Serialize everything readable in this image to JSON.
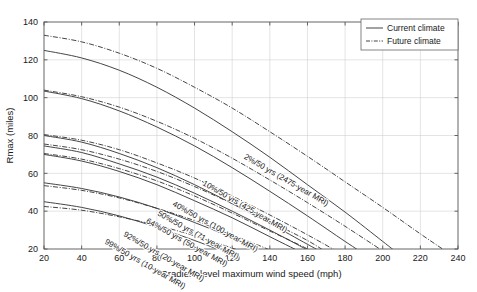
{
  "chart_data": {
    "type": "line",
    "title": "",
    "xlabel": "Gradient-level maximum wind speed (mph)",
    "ylabel": "Rmax (miles)",
    "xlim": [
      20,
      240
    ],
    "ylim": [
      20,
      140
    ],
    "xticks": [
      20,
      40,
      60,
      80,
      100,
      120,
      140,
      160,
      180,
      200,
      220,
      240
    ],
    "yticks": [
      20,
      40,
      60,
      80,
      100,
      120,
      140
    ],
    "grid": true,
    "legend_position": "top-right",
    "legend": [
      {
        "name": "Current climate",
        "style": "solid"
      },
      {
        "name": "Future climate",
        "style": "dash-dot"
      }
    ],
    "annotations": [
      "2%/50 yrs (2475-year MRI)",
      "10%/50 yrs (425-year MRI)",
      "40%/50 yrs (100-year MRI)",
      "50%/50 yrs (71-year MRI)",
      "64%/50 yrs (50-year MRI)",
      "92%/50 yrs (20-year MRI)",
      "99%/50 yrs (10-year MRI)"
    ],
    "series": [
      {
        "name": "2%/50 yrs (2475-year MRI)",
        "climate": "Current climate",
        "style": "solid",
        "x": [
          20,
          40,
          60,
          80,
          100,
          120,
          140,
          160,
          180,
          200,
          207
        ],
        "y": [
          125,
          121,
          114.5,
          105.5,
          94.5,
          82,
          68.5,
          54,
          39.5,
          24,
          18.5
        ]
      },
      {
        "name": "2%/50 yrs (2475-year MRI)",
        "climate": "Future climate",
        "style": "dash-dot",
        "x": [
          20,
          40,
          60,
          80,
          100,
          120,
          140,
          160,
          180,
          200,
          220,
          237
        ],
        "y": [
          133,
          129.5,
          123.5,
          115.5,
          105.5,
          94.5,
          82,
          69,
          55.5,
          42,
          28,
          16.5
        ]
      },
      {
        "name": "10%/50 yrs (425-year MRI)",
        "climate": "Current climate",
        "style": "solid",
        "x": [
          20,
          40,
          60,
          80,
          100,
          120,
          140,
          160,
          180,
          193
        ],
        "y": [
          103.5,
          99.5,
          93,
          84.5,
          74.5,
          63,
          50.5,
          37.5,
          24,
          15.5
        ]
      },
      {
        "name": "10%/50 yrs (425-year MRI)",
        "climate": "Future climate",
        "style": "dash-dot",
        "x": [
          20,
          40,
          60,
          80,
          100,
          120,
          140,
          160,
          180,
          200,
          207
        ],
        "y": [
          104,
          100.5,
          95,
          87.5,
          78.5,
          68,
          56.5,
          44.5,
          32,
          19,
          14.5
        ]
      },
      {
        "name": "40%/50 yrs (100-year MRI)",
        "climate": "Current climate",
        "style": "solid",
        "x": [
          20,
          40,
          60,
          80,
          100,
          120,
          140,
          160,
          172
        ],
        "y": [
          80,
          76.5,
          70.5,
          63,
          54,
          44,
          33.5,
          22.5,
          16
        ]
      },
      {
        "name": "40%/50 yrs (100-year MRI)",
        "climate": "Future climate",
        "style": "dash-dot",
        "x": [
          20,
          40,
          60,
          80,
          100,
          120,
          140,
          160,
          178
        ],
        "y": [
          80.5,
          77.5,
          72.5,
          65.5,
          57.5,
          48,
          38,
          27.5,
          17.5
        ]
      },
      {
        "name": "50%/50 yrs (71-year MRI)",
        "climate": "Current climate",
        "style": "solid",
        "x": [
          20,
          40,
          60,
          80,
          100,
          120,
          140,
          160,
          168
        ],
        "y": [
          74.5,
          71,
          65,
          58,
          49.5,
          40,
          30,
          19.5,
          15
        ]
      },
      {
        "name": "50%/50 yrs (71-year MRI)",
        "climate": "Future climate",
        "style": "dash-dot",
        "x": [
          20,
          40,
          60,
          80,
          100,
          120,
          140,
          160,
          172
        ],
        "y": [
          75.5,
          72.5,
          67.5,
          61,
          53,
          44,
          34.5,
          24.5,
          17
        ]
      },
      {
        "name": "64%/50 yrs (50-year MRI)",
        "climate": "Current climate",
        "style": "solid",
        "x": [
          20,
          40,
          60,
          80,
          100,
          120,
          140,
          160,
          164
        ],
        "y": [
          70,
          66.5,
          61,
          54,
          45.5,
          36.5,
          26.5,
          16.5,
          13.5
        ]
      },
      {
        "name": "64%/50 yrs (50-year MRI)",
        "climate": "Future climate",
        "style": "dash-dot",
        "x": [
          20,
          40,
          60,
          80,
          100,
          120,
          140,
          160,
          168
        ],
        "y": [
          70.5,
          67.5,
          62.5,
          56,
          48,
          39,
          29.5,
          20,
          14
        ]
      },
      {
        "name": "92%/50 yrs (20-year MRI)",
        "climate": "Current climate",
        "style": "solid",
        "x": [
          20,
          40,
          60,
          80,
          100,
          120,
          140,
          150
        ],
        "y": [
          55,
          52,
          47.5,
          41.5,
          34,
          26,
          17,
          12.5
        ]
      },
      {
        "name": "92%/50 yrs (20-year MRI)",
        "climate": "Future climate",
        "style": "dash-dot",
        "x": [
          20,
          40,
          60,
          80,
          100,
          120,
          140,
          156
        ],
        "y": [
          53.5,
          51,
          47,
          41.5,
          35,
          27.5,
          19.5,
          12.5
        ]
      },
      {
        "name": "99%/50 yrs (10-year MRI)",
        "climate": "Current climate",
        "style": "solid",
        "x": [
          20,
          40,
          60,
          80,
          100,
          112
        ],
        "y": [
          45,
          42,
          37.5,
          31.5,
          24.5,
          20
        ]
      },
      {
        "name": "99%/50 yrs (10-year MRI)",
        "climate": "Future climate",
        "style": "dash-dot",
        "x": [
          20,
          40,
          60,
          80,
          100,
          120,
          134
        ],
        "y": [
          42.5,
          40.5,
          37,
          32.5,
          27,
          20.5,
          15.5
        ]
      }
    ]
  }
}
